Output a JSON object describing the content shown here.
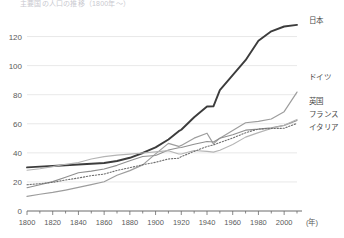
{
  "chart_data": {
    "type": "line",
    "title": "主要国の人口の推移（1800年〜）",
    "xlabel": "(年)",
    "ylabel": "",
    "xlim": [
      1800,
      2010
    ],
    "ylim": [
      0,
      130
    ],
    "grid": true,
    "legend_position": "right",
    "yticks": [
      "0",
      "20",
      "40",
      "60",
      "80",
      "100",
      "120"
    ],
    "ytick_values": [
      0,
      20,
      40,
      60,
      80,
      100,
      120
    ],
    "xticks": [
      "1800",
      "1820",
      "1840",
      "1860",
      "1880",
      "1900",
      "1920",
      "1940",
      "1960",
      "1980",
      "2000"
    ],
    "xtick_values": [
      1800,
      1820,
      1840,
      1860,
      1880,
      1900,
      1920,
      1940,
      1960,
      1980,
      2000
    ],
    "x": [
      1800,
      1810,
      1820,
      1830,
      1840,
      1850,
      1860,
      1870,
      1880,
      1890,
      1900,
      1910,
      1918,
      1920,
      1930,
      1940,
      1945,
      1950,
      1960,
      1970,
      1980,
      1990,
      2000,
      2010
    ],
    "series": [
      {
        "name": "日本",
        "label": "日本",
        "color": "#3c3c3c",
        "width": 1.9,
        "dash": "none",
        "values": [
          30,
          30.5,
          31,
          31.5,
          32,
          32.5,
          33,
          34.4,
          36.6,
          39.9,
          43.8,
          49.2,
          54.9,
          55.9,
          64.5,
          71.9,
          72,
          83.2,
          93.4,
          103.7,
          117.1,
          123.6,
          126.9,
          128
        ]
      },
      {
        "name": "ドイツ",
        "label": "ドイツ",
        "color": "#9d9d9d",
        "width": 1.2,
        "dash": "none",
        "values": [
          10,
          11.5,
          12.8,
          14.4,
          16.2,
          18.1,
          20.1,
          24.6,
          27.8,
          31.7,
          39.3,
          46.5,
          44.4,
          45.1,
          50.1,
          53.5,
          46.2,
          50.1,
          55.4,
          60.7,
          61.6,
          63.3,
          68.3,
          81.8
        ]
      },
      {
        "name": "英国",
        "label": "英国",
        "color": "#8f8f8f",
        "width": 1.1,
        "dash": "none",
        "values": [
          16,
          18,
          20.2,
          23.2,
          26.3,
          27.4,
          28.9,
          31.4,
          34.6,
          37.5,
          38.2,
          42,
          43.5,
          43.7,
          45.9,
          47.8,
          47.5,
          50.1,
          52.4,
          55.6,
          56.3,
          57.2,
          58.9,
          62.3
        ]
      },
      {
        "name": "フランス",
        "label": "フランス",
        "color": "#b4b4b4",
        "width": 1.1,
        "dash": "none",
        "values": [
          28,
          29.1,
          30.5,
          32.1,
          33.3,
          35.8,
          37.4,
          38.4,
          39.1,
          39.9,
          40.7,
          41.5,
          39.2,
          39.2,
          41.6,
          41,
          40.5,
          41.8,
          45.7,
          50.8,
          53.9,
          56.7,
          59,
          63
        ]
      },
      {
        "name": "イタリア",
        "label": "イタリア",
        "color": "#6e6e6e",
        "width": 1.1,
        "dash": "dotted",
        "values": [
          18.1,
          18.8,
          19.7,
          21.3,
          22.7,
          24.3,
          25.4,
          27.9,
          29.8,
          31.8,
          33.5,
          35.8,
          36.3,
          37.4,
          41,
          44.4,
          45.4,
          47.1,
          50.2,
          53.8,
          56.4,
          56.7,
          56.9,
          60.3
        ]
      }
    ]
  }
}
